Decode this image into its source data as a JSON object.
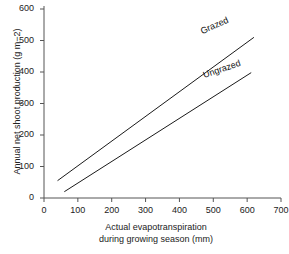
{
  "chart_data": {
    "type": "line",
    "title": "",
    "xlabel": "Actual evapotranspiration during growing season (mm)",
    "xlabel_line1": "Actual evapotranspiration",
    "xlabel_line2": "during growing season (mm)",
    "ylabel": "Annual net shoot production (g m−2)",
    "xlim": [
      0,
      700
    ],
    "ylim": [
      0,
      600
    ],
    "xticks": [
      0,
      100,
      200,
      300,
      400,
      500,
      600,
      700
    ],
    "yticks": [
      0,
      100,
      200,
      300,
      400,
      500,
      600
    ],
    "xtick_labels": [
      "0",
      "100",
      "200",
      "300",
      "400",
      "500",
      "600",
      "700"
    ],
    "ytick_labels": [
      "0",
      "100",
      "200",
      "300",
      "400",
      "500",
      "600"
    ],
    "grid": false,
    "legend_position": "inline-along-lines",
    "line_color": "#1a1a1a",
    "series": [
      {
        "name": "Grazed",
        "label": "Grazed",
        "x": [
          40,
          620
        ],
        "y": [
          55,
          510
        ],
        "style": "solid"
      },
      {
        "name": "Ungrazed",
        "label": "Ungrazed",
        "x": [
          60,
          612
        ],
        "y": [
          20,
          398
        ],
        "style": "solid"
      }
    ],
    "annotations": [
      {
        "text": "Grazed",
        "x": 560,
        "y": 490
      },
      {
        "text": "Ungrazed",
        "x": 545,
        "y": 355
      }
    ],
    "intersection": {
      "x": 215,
      "y": 175
    }
  },
  "figure": {
    "background_color": "#ffffff",
    "axis_color": "#555555"
  }
}
